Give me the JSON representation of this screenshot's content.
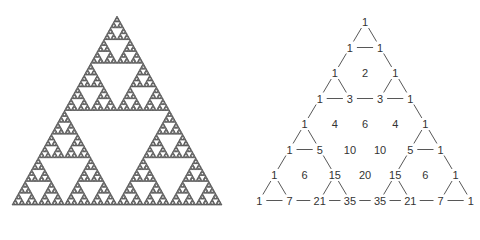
{
  "figure": {
    "left_panel": {
      "name": "Sierpinski triangle",
      "depth": 6,
      "apex": [
        117,
        16
      ],
      "base_left": [
        12,
        205
      ],
      "base_right": [
        222,
        205
      ],
      "fill_color": "#7a7a7a",
      "stroke_color": "#3a3a3a",
      "hole_color": "#ffffff"
    },
    "right_panel": {
      "name": "Pascal's triangle (rows 0-7) with odd entries connected",
      "origin_x": 365,
      "origin_y": 22,
      "dx": 15.1,
      "dy": 25.5,
      "text_color": "#333333",
      "line_color": "#444444",
      "rows": [
        [
          "1"
        ],
        [
          "1",
          "1"
        ],
        [
          "1",
          "2",
          "1"
        ],
        [
          "1",
          "3",
          "3",
          "1"
        ],
        [
          "1",
          "4",
          "6",
          "4",
          "1"
        ],
        [
          "1",
          "5",
          "10",
          "10",
          "5",
          "1"
        ],
        [
          "1",
          "6",
          "15",
          "20",
          "15",
          "6",
          "1"
        ],
        [
          "1",
          "7",
          "21",
          "35",
          "35",
          "21",
          "7",
          "1"
        ]
      ]
    }
  }
}
